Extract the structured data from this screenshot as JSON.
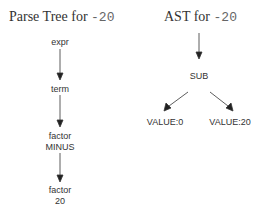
{
  "parse_tree": {
    "title_prefix": "Parse Tree for ",
    "title_code": "-20",
    "nodes": [
      {
        "line1": "expr",
        "line2": ""
      },
      {
        "line1": "term",
        "line2": ""
      },
      {
        "line1": "factor",
        "line2": "MINUS"
      },
      {
        "line1": "factor",
        "line2": "20"
      }
    ]
  },
  "ast": {
    "title_prefix": "AST for ",
    "title_code": "-20",
    "root": "SUB",
    "left": "VALUE:0",
    "right": "VALUE:20"
  },
  "colors": {
    "text": "#333333",
    "edge": "#222222"
  }
}
